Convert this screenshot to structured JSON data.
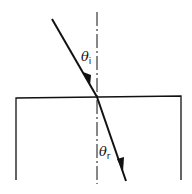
{
  "diagram": {
    "labels": {
      "incident_angle": {
        "symbol": "θ",
        "subscript": "i"
      },
      "refracted_angle": {
        "symbol": "θ",
        "subscript": "r"
      }
    },
    "elements": [
      "normal-line",
      "surface-boundary",
      "incident-ray",
      "refracted-ray"
    ],
    "colors": {
      "ink": "#111111",
      "background": "#ffffff"
    }
  }
}
